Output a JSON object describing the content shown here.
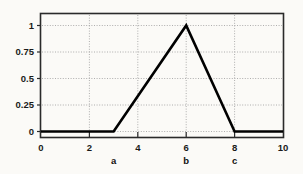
{
  "chart_data": {
    "type": "line",
    "title": "",
    "subtitle": "",
    "xlabel": "",
    "ylabel": "",
    "xlim": [
      0,
      10
    ],
    "ylim": [
      0,
      1
    ],
    "grid": true,
    "legend": null,
    "legend_position": "none",
    "x_ticks": [
      "0",
      "2",
      "4",
      "6",
      "8",
      "10"
    ],
    "x_tick_values": [
      0,
      2,
      4,
      6,
      8,
      10
    ],
    "y_ticks": [
      "0",
      "0.25",
      "0.5",
      "0.75",
      "1"
    ],
    "y_tick_values": [
      0,
      0.25,
      0.5,
      0.75,
      1
    ],
    "series": [
      {
        "name": "triangular-membership",
        "x": [
          0,
          3,
          6,
          8,
          10
        ],
        "values": [
          0,
          0,
          1,
          0,
          0
        ]
      }
    ],
    "annotations": [
      {
        "label": "a",
        "x": 3,
        "y": 0
      },
      {
        "label": "b",
        "x": 6,
        "y": 0
      },
      {
        "label": "c",
        "x": 8,
        "y": 0
      }
    ],
    "colors": {
      "line": "#000000",
      "grid": "#9a9a9a",
      "frame": "#2a2a2a",
      "background": "#fbfaf7",
      "text": "#1a1a1a"
    }
  }
}
